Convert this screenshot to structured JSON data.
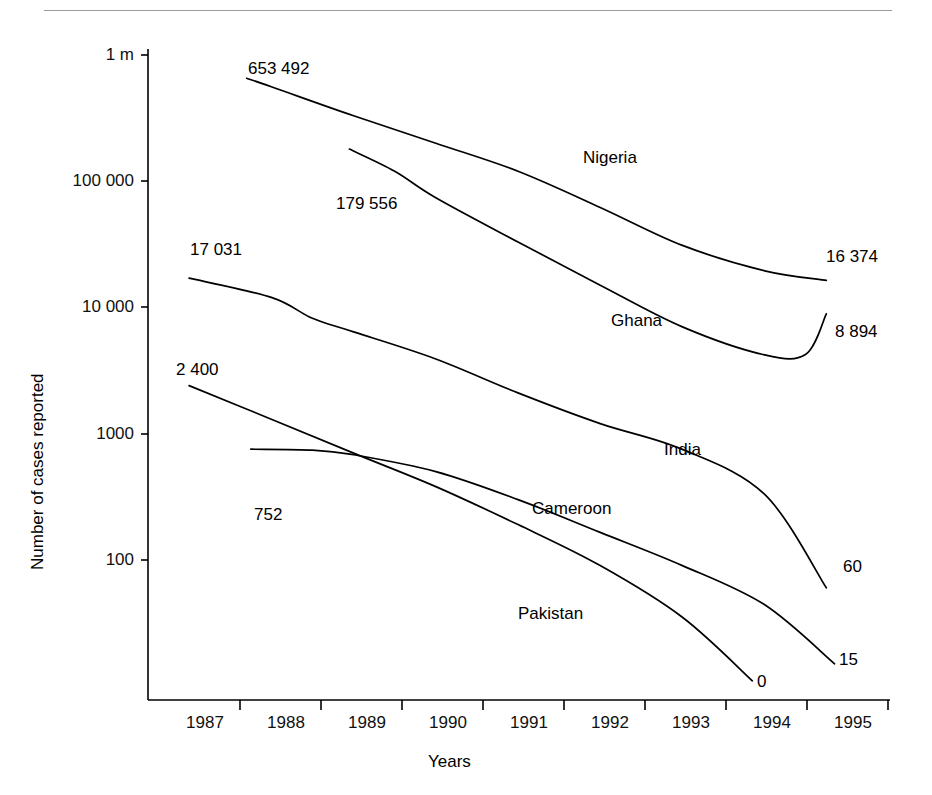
{
  "page": {
    "top_rule": true
  },
  "chart_data": {
    "type": "line",
    "title": "",
    "xlabel": "Years",
    "ylabel": "Number of cases reported",
    "y_scale": "log",
    "ylim": [
      10,
      1000000
    ],
    "y_ticks": [
      {
        "value": 1000000,
        "label": "1 m"
      },
      {
        "value": 100000,
        "label": "100 000"
      },
      {
        "value": 10000,
        "label": "10 000"
      },
      {
        "value": 1000,
        "label": "1000"
      },
      {
        "value": 100,
        "label": "100"
      }
    ],
    "x": [
      1987,
      1988,
      1989,
      1990,
      1991,
      1992,
      1993,
      1994,
      1995
    ],
    "x_tick_labels": [
      "1987",
      "1988",
      "1989",
      "1990",
      "1991",
      "1992",
      "1993",
      "1994",
      "1995"
    ],
    "grid": false,
    "legend": "inline-labels",
    "series": [
      {
        "name": "Nigeria",
        "start_label": "653 492",
        "end_label": "16 374",
        "x": [
          1987.7,
          1988,
          1989,
          1990,
          1991,
          1992,
          1993,
          1994,
          1994.75
        ],
        "values": [
          653492,
          560000,
          330000,
          200000,
          120000,
          62000,
          31000,
          19500,
          16374
        ]
      },
      {
        "name": "Ghana",
        "start_label": "179 556",
        "end_label": "8 894",
        "x": [
          1988.95,
          1989.5,
          1990,
          1991,
          1992,
          1993,
          1994,
          1994.5,
          1994.75
        ],
        "values": [
          179556,
          120000,
          74000,
          33000,
          15000,
          7000,
          4200,
          4250,
          8894
        ]
      },
      {
        "name": "India",
        "start_label": "17 031",
        "end_label": "60",
        "x": [
          1987,
          1988,
          1988.5,
          1989,
          1990,
          1991,
          1992,
          1993,
          1994,
          1994.75
        ],
        "values": [
          17031,
          12000,
          8200,
          6400,
          3900,
          2100,
          1200,
          750,
          330,
          60
        ]
      },
      {
        "name": "Cameroon",
        "start_label": "752",
        "end_label": "15",
        "x": [
          1987.75,
          1988.5,
          1989,
          1990,
          1991,
          1992,
          1993,
          1994,
          1994.85
        ],
        "values": [
          752,
          740,
          680,
          500,
          300,
          165,
          90,
          44,
          15
        ]
      },
      {
        "name": "Pakistan",
        "start_label": "2 400",
        "end_label": "0",
        "x": [
          1987,
          1988,
          1989,
          1990,
          1991,
          1992,
          1993,
          1993.85
        ],
        "values": [
          2400,
          1300,
          700,
          380,
          190,
          90,
          35,
          11
        ]
      }
    ],
    "value_labels": [
      {
        "text": "653 492",
        "series": "Nigeria",
        "position": "start"
      },
      {
        "text": "16 374",
        "series": "Nigeria",
        "position": "end"
      },
      {
        "text": "179 556",
        "series": "Ghana",
        "position": "start"
      },
      {
        "text": "8 894",
        "series": "Ghana",
        "position": "end"
      },
      {
        "text": "17 031",
        "series": "India",
        "position": "start"
      },
      {
        "text": "60",
        "series": "India",
        "position": "end"
      },
      {
        "text": "752",
        "series": "Cameroon",
        "position": "start"
      },
      {
        "text": "15",
        "series": "Cameroon",
        "position": "end"
      },
      {
        "text": "2 400",
        "series": "Pakistan",
        "position": "start"
      },
      {
        "text": "0",
        "series": "Pakistan",
        "position": "end"
      }
    ],
    "colors": {
      "line": "#000000",
      "axis": "#000000",
      "text": "#111111",
      "background": "#ffffff",
      "top_rule": "#9b9b9b"
    }
  }
}
